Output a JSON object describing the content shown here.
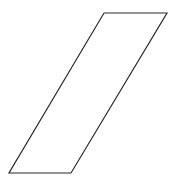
{
  "canvas": {
    "width": 175,
    "height": 186,
    "background_color": "#ffffff"
  },
  "figure": {
    "name": "parallelogram",
    "shape_type": "parallelogram",
    "stroke_color": "#2b2b2b",
    "stroke_width": 1.2,
    "fill_color": "none",
    "vertices": [
      {
        "label": "top-left",
        "x": 104,
        "y": 13
      },
      {
        "label": "top-right",
        "x": 167,
        "y": 13
      },
      {
        "label": "bottom-right",
        "x": 71,
        "y": 173
      },
      {
        "label": "bottom-left",
        "x": 9,
        "y": 173
      }
    ],
    "points_attr": "104,13 167,13 71,173 9,173"
  },
  "labels": {
    "title": "",
    "annotations": []
  }
}
